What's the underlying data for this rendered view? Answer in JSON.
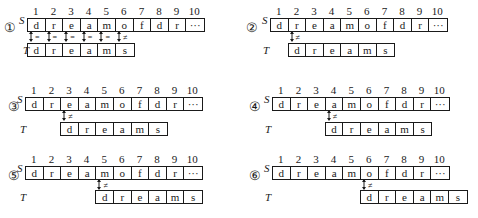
{
  "positions": [
    "1",
    "2",
    "3",
    "4",
    "5",
    "6",
    "7",
    "8",
    "9",
    "10"
  ],
  "S": {
    "label": "S",
    "cells": [
      "d",
      "r",
      "e",
      "a",
      "m",
      "o",
      "f",
      "d",
      "r",
      "···"
    ]
  },
  "T": {
    "label": "T",
    "cells": [
      "d",
      "r",
      "e",
      "a",
      "m",
      "s"
    ]
  },
  "symbols": {
    "eq": "=",
    "neq": "≠"
  },
  "panels": [
    {
      "marker": "①",
      "offset": 0,
      "comparisons": [
        "=",
        "=",
        "=",
        "=",
        "=",
        "≠"
      ]
    },
    {
      "marker": "②",
      "offset": 1,
      "comparisons": [
        "≠"
      ]
    },
    {
      "marker": "③",
      "offset": 2,
      "comparisons": [
        "≠"
      ]
    },
    {
      "marker": "④",
      "offset": 3,
      "comparisons": [
        "≠"
      ]
    },
    {
      "marker": "⑤",
      "offset": 4,
      "comparisons": [
        "≠"
      ]
    },
    {
      "marker": "⑥",
      "offset": 5,
      "comparisons": [
        "≠"
      ]
    }
  ]
}
